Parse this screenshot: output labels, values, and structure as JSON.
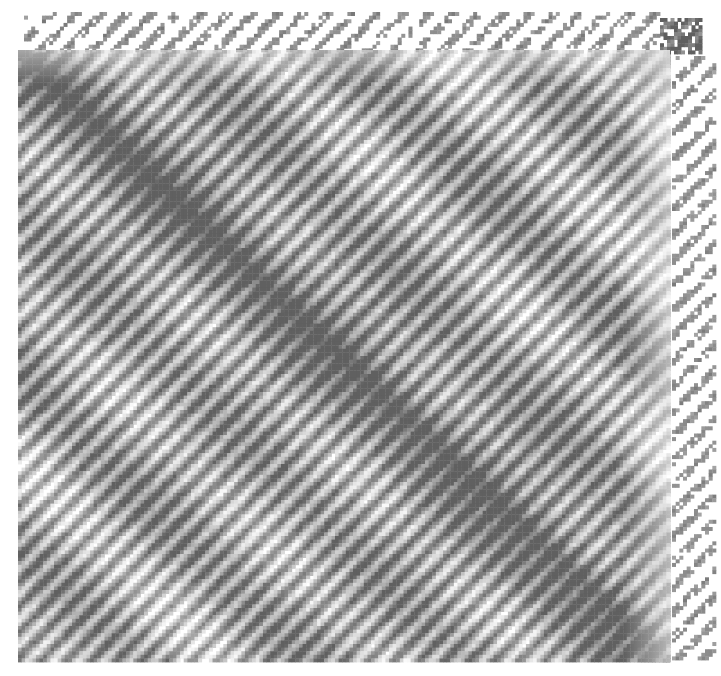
{
  "figure": {
    "title_clipped": "Cophenetic correlation matrix ordered by hierarchical clustering",
    "width": 721,
    "height": 676,
    "background": "#ffffff",
    "type": "heatmap-matrix"
  },
  "chart_data": {
    "type": "heatmap",
    "title": "Cophenetic correlation matrix ordered by hierarchical clustering",
    "xlabel": "",
    "ylabel": "",
    "grid": false,
    "legend": "none",
    "symmetric": true,
    "colormap": {
      "name": "grayscale",
      "low_color": "#ffffff",
      "mid_color": "#9a9a9a",
      "high_color": "#6e6e6e",
      "min_value": 0.0,
      "max_value": 1.0
    },
    "cell_size_px": 3.6,
    "blocks": [
      {
        "name": "main-matrix",
        "x": 18,
        "y": 50,
        "width": 652,
        "height": 612,
        "rows": 170,
        "cols": 181,
        "density": 1.0,
        "base_level": 0.55,
        "diagonal_strength": 0.92,
        "stripe_period": 7.0,
        "stripe_angle_deg": 45,
        "description": "Dense anti-aliased diagonal hatch matrix with strong main diagonal band"
      },
      {
        "name": "top-sparse-band",
        "x": 24,
        "y": 12,
        "width": 636,
        "height": 40,
        "rows": 11,
        "cols": 177,
        "density": 0.18,
        "base_level": 0.22,
        "diagonal_strength": 0.35,
        "stripe_period": 7.0,
        "stripe_angle_deg": 45,
        "description": "Sparse descending diagonal dash band above the main matrix"
      },
      {
        "name": "corner-block",
        "x": 660,
        "y": 18,
        "width": 42,
        "height": 36,
        "rows": 10,
        "cols": 12,
        "density": 0.95,
        "base_level": 0.72,
        "diagonal_strength": 0.85,
        "stripe_period": 6.0,
        "stripe_angle_deg": 45,
        "description": "Small dark detached square block at the top right corner"
      },
      {
        "name": "right-sparse-column",
        "x": 672,
        "y": 56,
        "width": 44,
        "height": 604,
        "rows": 168,
        "cols": 12,
        "density": 0.14,
        "base_level": 0.2,
        "diagonal_strength": 0.3,
        "stripe_period": 7.0,
        "stripe_angle_deg": 45,
        "description": "Sparse vertical column of diagonal dashes at the right margin"
      }
    ],
    "axis_ranges": {
      "x": [
        0,
        181
      ],
      "y": [
        0,
        170
      ]
    },
    "tick_labels": {
      "x": [],
      "y": []
    },
    "annotations": []
  }
}
